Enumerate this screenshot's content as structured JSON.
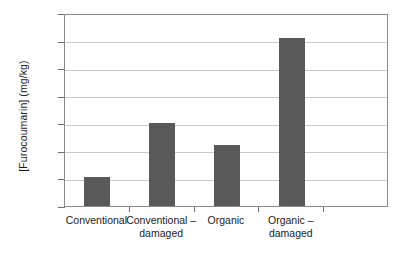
{
  "chart_data": {
    "type": "bar",
    "title": "",
    "xlabel": "",
    "ylabel": "[Furocoumarin] (mg/kg)",
    "categories": [
      "Conventional",
      "Conventional –\ndamaged",
      "Organic",
      "Organic –\ndamaged"
    ],
    "category_plain": [
      "Conventional",
      "Conventional – damaged",
      "Organic",
      "Organic – damaged"
    ],
    "values": [
      21,
      60,
      44,
      122
    ],
    "ylim": [
      0,
      140
    ],
    "yticks": [
      0,
      20,
      40,
      60,
      80,
      100,
      120,
      140
    ],
    "ytick_labels": [
      "0",
      "20",
      "40",
      "60",
      "80",
      "100",
      "120",
      "140"
    ],
    "grid": true,
    "legend": false,
    "bar_color": "#595959",
    "gridline_color": "#c9c9c9",
    "frame_color": "#8a8a8a",
    "background": "#ffffff",
    "n_slots": 5
  }
}
